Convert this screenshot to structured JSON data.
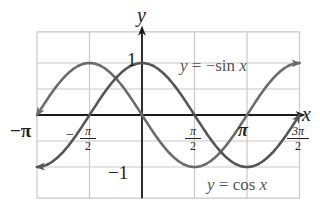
{
  "chart_data": {
    "type": "line",
    "title": "",
    "xlabel": "x",
    "ylabel": "y",
    "xlim": [
      -3.14159,
      4.71239
    ],
    "ylim": [
      -1.5,
      1.5
    ],
    "grid": true,
    "x_ticks": [
      {
        "value": -3.14159,
        "label": "−π"
      },
      {
        "value": -1.5708,
        "label": "−π/2",
        "sign": "−",
        "num": "π",
        "den": "2"
      },
      {
        "value": 1.5708,
        "label": "π/2",
        "num": "π",
        "den": "2"
      },
      {
        "value": 3.14159,
        "label": "π"
      },
      {
        "value": 4.71239,
        "label": "3π/2",
        "num": "3π",
        "den": "2"
      }
    ],
    "y_ticks": [
      {
        "value": 1,
        "label": "1"
      },
      {
        "value": -1,
        "label": "−1"
      }
    ],
    "series": [
      {
        "name": "y = −sin x",
        "function": "-sin(x)",
        "domain": [
          -3.14159,
          4.71239
        ],
        "color": "#6b6b6b",
        "arrows_both_ends": true,
        "x": [
          -3.14159,
          -1.5708,
          0,
          1.5708,
          3.14159,
          4.71239
        ],
        "values": [
          0,
          1,
          0,
          -1,
          0,
          1
        ]
      },
      {
        "name": "y = cos x",
        "function": "cos(x)",
        "domain": [
          -3.14159,
          4.71239
        ],
        "color": "#555555",
        "arrows_both_ends": true,
        "x": [
          -3.14159,
          -1.5708,
          0,
          1.5708,
          3.14159,
          4.71239
        ],
        "values": [
          -1,
          0,
          1,
          0,
          -1,
          0
        ]
      }
    ],
    "annotations": [
      {
        "text": "y = −sin x",
        "near": [
          2.4,
          1
        ]
      },
      {
        "text": "y = cos x",
        "near": [
          2.9,
          -1.3
        ]
      }
    ]
  },
  "labels": {
    "y_axis": "y",
    "x_axis": "x",
    "neg_pi": "−π",
    "neg_half_pi_sign": "−",
    "pi_sym": "π",
    "two": "2",
    "pi": "π",
    "three_pi": "3π",
    "one": "1",
    "neg_one": "−1",
    "sin_label": "y = −sin x",
    "cos_label": "y = cos x"
  }
}
